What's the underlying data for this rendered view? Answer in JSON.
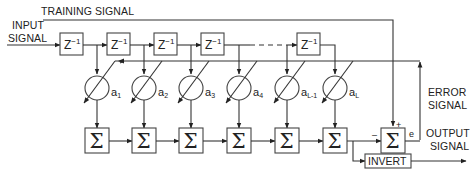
{
  "labels": {
    "training_signal": "TRAINING SIGNAL",
    "input_signal_line1": "INPUT",
    "input_signal_line2": "SIGNAL",
    "error_signal_line1": "ERROR",
    "error_signal_line2": "SIGNAL",
    "output_signal_line1": "OUTPUT",
    "output_signal_line2": "SIGNAL",
    "invert": "INVERT",
    "error_symbol": "e",
    "plus_sign": "+",
    "minus_sign": "–"
  },
  "delays": [
    {
      "base": "Z",
      "exp": "−1"
    },
    {
      "base": "Z",
      "exp": "−1"
    },
    {
      "base": "Z",
      "exp": "−1"
    },
    {
      "base": "Z",
      "exp": "−1"
    },
    {
      "base": "Z",
      "exp": "−1"
    }
  ],
  "coefficients": [
    {
      "base": "a",
      "sub": "1"
    },
    {
      "base": "a",
      "sub": "2"
    },
    {
      "base": "a",
      "sub": "3"
    },
    {
      "base": "a",
      "sub": "4"
    },
    {
      "base": "a",
      "sub": "L-1"
    },
    {
      "base": "a",
      "sub": "L"
    }
  ],
  "summers": [
    "Σ",
    "Σ",
    "Σ",
    "Σ",
    "Σ",
    "Σ"
  ],
  "error_summer": "Σ"
}
